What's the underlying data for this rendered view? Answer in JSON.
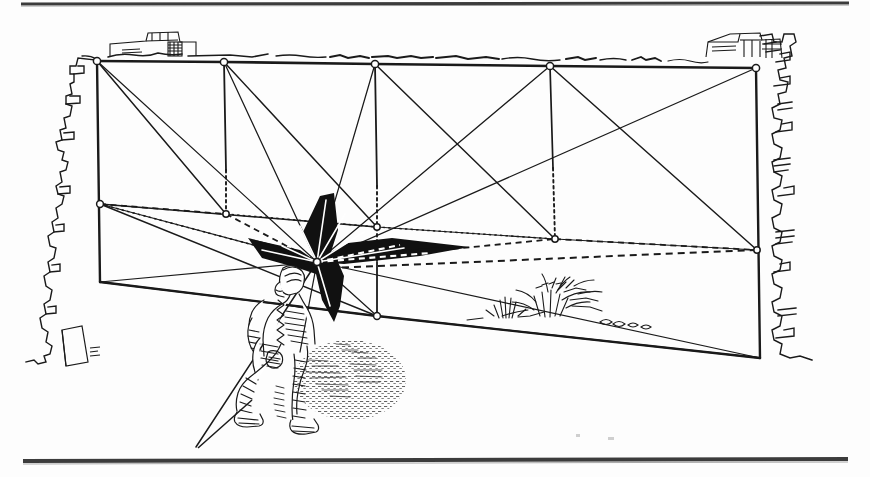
{
  "figure": {
    "title": "Two-point perspective construction with kneeling figure and radiating star burst",
    "medium": "pen-and-ink line drawing",
    "ink_color": "#1a1a1a",
    "paper_color": "#fdfdfd",
    "width": 870,
    "height": 477
  },
  "rules": {
    "top_rule": {
      "x1": 21,
      "y1": 4,
      "x2": 849,
      "y2": 3,
      "thickness": 3
    },
    "bottom_rule": {
      "x1": 23,
      "y1": 462,
      "x2": 848,
      "y2": 460,
      "thickness": 4
    }
  },
  "vanishing_point": {
    "x": 317,
    "y": 262,
    "label": "station-point"
  },
  "top_edge": {
    "label": "upper horizontal construction edge",
    "vertices": [
      {
        "x": 97,
        "y": 61
      },
      {
        "x": 224,
        "y": 62
      },
      {
        "x": 375,
        "y": 64
      },
      {
        "x": 550,
        "y": 66
      },
      {
        "x": 756,
        "y": 68
      }
    ]
  },
  "mid_edge": {
    "label": "middle horizon construction edge",
    "vertices": [
      {
        "x": 100,
        "y": 204
      },
      {
        "x": 226,
        "y": 214
      },
      {
        "x": 375,
        "y": 227
      },
      {
        "x": 555,
        "y": 239
      },
      {
        "x": 757,
        "y": 250
      }
    ]
  },
  "ground_edge": {
    "label": "lower ground construction edge",
    "vertices": [
      {
        "x": 100,
        "y": 282
      },
      {
        "x": 377,
        "y": 316
      },
      {
        "x": 760,
        "y": 358
      }
    ]
  },
  "verticals": {
    "label": "vertical posts dropped from the upper edge",
    "solid": [
      {
        "x1": 97,
        "y1": 61,
        "x2": 100,
        "y2": 282
      },
      {
        "x1": 224,
        "y1": 62,
        "x2": 226,
        "y2": 214
      },
      {
        "x1": 375,
        "y1": 64,
        "x2": 377,
        "y2": 316
      },
      {
        "x1": 550,
        "y1": 66,
        "x2": 553,
        "y2": 168
      },
      {
        "x1": 756,
        "y1": 68,
        "x2": 760,
        "y2": 358
      }
    ],
    "dotted": [
      {
        "x1": 226,
        "y1": 170,
        "x2": 226,
        "y2": 214
      },
      {
        "x1": 377,
        "y1": 186,
        "x2": 377,
        "y2": 262
      },
      {
        "x1": 553,
        "y1": 168,
        "x2": 555,
        "y2": 239
      }
    ]
  },
  "star_burst": {
    "label": "four-point black star radiating from the station point",
    "fill": "#111111",
    "center": {
      "x": 317,
      "y": 262
    },
    "points": [
      {
        "direction": "up",
        "tip_x": 333,
        "tip_y": 193,
        "width": 36
      },
      {
        "direction": "right",
        "tip_x": 470,
        "tip_y": 247,
        "width": 30
      },
      {
        "direction": "down",
        "tip_x": 334,
        "tip_y": 322,
        "width": 30
      },
      {
        "direction": "left",
        "tip_x": 248,
        "tip_y": 238,
        "width": 22
      }
    ]
  },
  "rays": {
    "label": "construction rays converging on the station point",
    "count": 14,
    "endpoints": [
      {
        "x": 97,
        "y": 61
      },
      {
        "x": 224,
        "y": 62
      },
      {
        "x": 375,
        "y": 64
      },
      {
        "x": 550,
        "y": 66
      },
      {
        "x": 756,
        "y": 68
      },
      {
        "x": 100,
        "y": 204
      },
      {
        "x": 226,
        "y": 214
      },
      {
        "x": 375,
        "y": 227
      },
      {
        "x": 555,
        "y": 239
      },
      {
        "x": 757,
        "y": 250
      },
      {
        "x": 100,
        "y": 282
      },
      {
        "x": 377,
        "y": 316
      },
      {
        "x": 760,
        "y": 358
      },
      {
        "x": 196,
        "y": 447
      }
    ]
  },
  "diagonals": {
    "label": "panel diagonals drawn corner to corner",
    "lines": [
      {
        "x1": 97,
        "y1": 61,
        "x2": 226,
        "y2": 214
      },
      {
        "x1": 224,
        "y1": 62,
        "x2": 375,
        "y2": 227
      },
      {
        "x1": 550,
        "y1": 66,
        "x2": 757,
        "y2": 250
      },
      {
        "x1": 375,
        "y1": 64,
        "x2": 555,
        "y2": 239
      },
      {
        "x1": 100,
        "y1": 204,
        "x2": 377,
        "y2": 316
      },
      {
        "x1": 100,
        "y1": 282,
        "x2": 377,
        "y2": 316
      }
    ]
  },
  "dashed_lines": {
    "label": "receding dashed lines on the middle plane",
    "lines": [
      {
        "x1": 100,
        "y1": 204,
        "x2": 317,
        "y2": 262
      },
      {
        "x1": 317,
        "y1": 262,
        "x2": 555,
        "y2": 239
      },
      {
        "x1": 555,
        "y1": 239,
        "x2": 757,
        "y2": 250
      },
      {
        "x1": 317,
        "y1": 262,
        "x2": 757,
        "y2": 250
      },
      {
        "x1": 226,
        "y1": 214,
        "x2": 317,
        "y2": 262
      }
    ]
  },
  "figure_person": {
    "label": "kneeling man sketched in hatched pen strokes",
    "pose": "crouching on one knee, facing right",
    "bbox": {
      "x": 225,
      "y": 266,
      "width": 115,
      "height": 160
    }
  },
  "shadow": {
    "label": "stippled cast shadow on the ground plane",
    "bbox": {
      "x": 295,
      "y": 340,
      "width": 110,
      "height": 80
    }
  },
  "foliage": {
    "label": "grass tufts and low shrub on the ground line",
    "bbox": {
      "x": 490,
      "y": 286,
      "width": 160,
      "height": 42
    }
  },
  "ragged_left_edge": {
    "label": "torn / rough left margin contour of the drawing",
    "bbox": {
      "x": 58,
      "y": 40,
      "width": 46,
      "height": 330
    }
  },
  "ragged_right_edge": {
    "label": "torn / rough right margin contour of the drawing",
    "bbox": {
      "x": 760,
      "y": 36,
      "width": 48,
      "height": 340
    }
  },
  "skyline_left": {
    "label": "small distant building block top-left",
    "bbox": {
      "x": 105,
      "y": 30,
      "width": 80,
      "height": 32
    }
  },
  "skyline_right": {
    "label": "small distant building block top-right",
    "bbox": {
      "x": 700,
      "y": 28,
      "width": 80,
      "height": 35
    }
  },
  "horizon_sketch": {
    "label": "broken freehand distant horizon line across the top"
  }
}
